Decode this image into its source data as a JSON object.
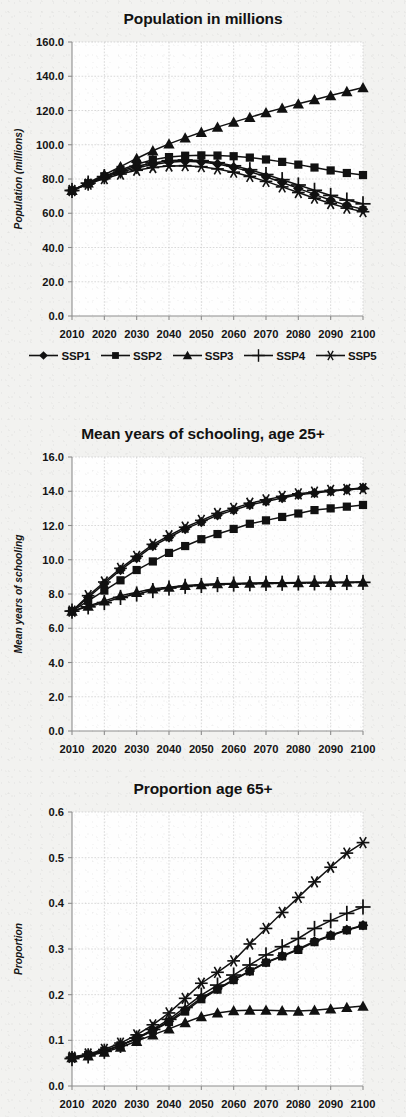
{
  "figure": {
    "background_color": "#f2f2f0",
    "series_color": "#111111"
  },
  "legend": {
    "items": [
      {
        "label": "SSP1",
        "marker": "diamond",
        "icon": "diamond-marker-icon"
      },
      {
        "label": "SSP2",
        "marker": "square",
        "icon": "square-marker-icon"
      },
      {
        "label": "SSP3",
        "marker": "triangle",
        "icon": "triangle-marker-icon"
      },
      {
        "label": "SSP4",
        "marker": "plus",
        "icon": "plus-marker-icon"
      },
      {
        "label": "SSP5",
        "marker": "asterisk",
        "icon": "asterisk-marker-icon"
      }
    ]
  },
  "chart_data": [
    {
      "id": "population",
      "type": "line",
      "title": "Population in millions",
      "xlabel": "",
      "ylabel": "Population (millions)",
      "x": [
        2010,
        2015,
        2020,
        2025,
        2030,
        2035,
        2040,
        2045,
        2050,
        2055,
        2060,
        2065,
        2070,
        2075,
        2080,
        2085,
        2090,
        2095,
        2100
      ],
      "xticks": [
        2010,
        2020,
        2030,
        2040,
        2050,
        2060,
        2070,
        2080,
        2090,
        2100
      ],
      "xticklabels": [
        "2010",
        "2020",
        "2030",
        "2040",
        "2050",
        "2060",
        "2070",
        "2080",
        "2090",
        "2100"
      ],
      "xlim": [
        2010,
        2100
      ],
      "ylim": [
        0.0,
        160.0
      ],
      "yticks": [
        0.0,
        20.0,
        40.0,
        60.0,
        80.0,
        100.0,
        120.0,
        140.0,
        160.0
      ],
      "yticklabels": [
        "0.0",
        "20.0",
        "40.0",
        "60.0",
        "80.0",
        "100.0",
        "120.0",
        "140.0",
        "160.0"
      ],
      "grid": true,
      "legend_position": "below",
      "series": [
        {
          "name": "SSP1",
          "marker": "diamond",
          "values": [
            73.3,
            77.2,
            80.8,
            83.9,
            86.5,
            88.5,
            89.8,
            90.3,
            89.9,
            88.7,
            86.8,
            84.3,
            81.3,
            78.0,
            74.5,
            71.0,
            67.6,
            64.6,
            62.3
          ]
        },
        {
          "name": "SSP2",
          "marker": "square",
          "values": [
            73.3,
            77.5,
            81.6,
            85.3,
            88.6,
            91.2,
            92.8,
            93.6,
            93.8,
            93.7,
            93.3,
            92.5,
            91.4,
            90.0,
            88.4,
            86.7,
            85.0,
            83.5,
            82.3
          ]
        },
        {
          "name": "SSP3",
          "marker": "triangle",
          "values": [
            73.3,
            77.8,
            82.5,
            87.2,
            92.0,
            96.5,
            100.5,
            104.0,
            107.3,
            110.3,
            113.2,
            116.0,
            118.8,
            121.4,
            123.9,
            126.3,
            128.7,
            131.1,
            133.4
          ]
        },
        {
          "name": "SSP4",
          "marker": "plus",
          "values": [
            73.3,
            77.6,
            81.4,
            84.7,
            87.4,
            89.4,
            90.7,
            91.1,
            90.7,
            89.5,
            87.7,
            85.4,
            82.6,
            79.6,
            76.5,
            73.4,
            70.4,
            67.7,
            65.5
          ]
        },
        {
          "name": "SSP5",
          "marker": "asterisk",
          "values": [
            73.3,
            77.0,
            80.2,
            82.9,
            85.1,
            86.7,
            87.6,
            87.8,
            87.2,
            85.9,
            84.0,
            81.5,
            78.6,
            75.4,
            72.1,
            68.8,
            65.7,
            63.0,
            60.9
          ]
        }
      ]
    },
    {
      "id": "schooling",
      "type": "line",
      "title": "Mean years of schooling, age 25+",
      "xlabel": "",
      "ylabel": "Mean years of schooling",
      "x": [
        2010,
        2015,
        2020,
        2025,
        2030,
        2035,
        2040,
        2045,
        2050,
        2055,
        2060,
        2065,
        2070,
        2075,
        2080,
        2085,
        2090,
        2095,
        2100
      ],
      "xticks": [
        2010,
        2020,
        2030,
        2040,
        2050,
        2060,
        2070,
        2080,
        2090,
        2100
      ],
      "xticklabels": [
        "2010",
        "2020",
        "2030",
        "2040",
        "2050",
        "2060",
        "2070",
        "2080",
        "2090",
        "2100"
      ],
      "xlim": [
        2010,
        2100
      ],
      "ylim": [
        0.0,
        16.0
      ],
      "yticks": [
        0.0,
        2.0,
        4.0,
        6.0,
        8.0,
        10.0,
        12.0,
        14.0,
        16.0
      ],
      "yticklabels": [
        "0.0",
        "2.0",
        "4.0",
        "6.0",
        "8.0",
        "10.0",
        "12.0",
        "14.0",
        "16.0"
      ],
      "grid": true,
      "legend_position": "none",
      "series": [
        {
          "name": "SSP1",
          "marker": "diamond",
          "values": [
            7.0,
            7.8,
            8.6,
            9.4,
            10.1,
            10.8,
            11.3,
            11.8,
            12.2,
            12.6,
            12.9,
            13.2,
            13.4,
            13.6,
            13.8,
            13.9,
            14.0,
            14.1,
            14.2
          ]
        },
        {
          "name": "SSP2",
          "marker": "square",
          "values": [
            7.0,
            7.6,
            8.2,
            8.8,
            9.4,
            9.9,
            10.4,
            10.8,
            11.2,
            11.5,
            11.8,
            12.1,
            12.3,
            12.5,
            12.7,
            12.9,
            13.0,
            13.1,
            13.2
          ]
        },
        {
          "name": "SSP3",
          "marker": "triangle",
          "values": [
            7.0,
            7.3,
            7.6,
            7.9,
            8.1,
            8.3,
            8.4,
            8.5,
            8.55,
            8.6,
            8.62,
            8.64,
            8.65,
            8.66,
            8.67,
            8.68,
            8.68,
            8.69,
            8.7
          ]
        },
        {
          "name": "SSP4",
          "marker": "plus",
          "values": [
            7.0,
            7.25,
            7.5,
            7.8,
            8.0,
            8.2,
            8.35,
            8.45,
            8.5,
            8.55,
            8.58,
            8.6,
            8.62,
            8.63,
            8.64,
            8.65,
            8.66,
            8.67,
            8.68
          ]
        },
        {
          "name": "SSP5",
          "marker": "asterisk",
          "values": [
            7.0,
            7.9,
            8.7,
            9.5,
            10.2,
            10.9,
            11.4,
            11.9,
            12.3,
            12.7,
            13.0,
            13.3,
            13.5,
            13.7,
            13.85,
            13.95,
            14.05,
            14.1,
            14.15
          ]
        }
      ]
    },
    {
      "id": "proportion65",
      "type": "line",
      "title": "Proportion age 65+",
      "xlabel": "",
      "ylabel": "Proportion",
      "x": [
        2010,
        2015,
        2020,
        2025,
        2030,
        2035,
        2040,
        2045,
        2050,
        2055,
        2060,
        2065,
        2070,
        2075,
        2080,
        2085,
        2090,
        2095,
        2100
      ],
      "xticks": [
        2010,
        2020,
        2030,
        2040,
        2050,
        2060,
        2070,
        2080,
        2090,
        2100
      ],
      "xticklabels": [
        "2010",
        "2020",
        "2030",
        "2040",
        "2050",
        "2060",
        "2070",
        "2080",
        "2090",
        "2100"
      ],
      "xlim": [
        2010,
        2100
      ],
      "ylim": [
        0.0,
        0.6
      ],
      "yticks": [
        0.0,
        0.1,
        0.2,
        0.3,
        0.4,
        0.5,
        0.6
      ],
      "yticklabels": [
        "0.0",
        "0.1",
        "0.2",
        "0.3",
        "0.4",
        "0.5",
        "0.6"
      ],
      "grid": true,
      "legend_position": "none",
      "series": [
        {
          "name": "SSP1",
          "marker": "diamond",
          "values": [
            0.063,
            0.068,
            0.077,
            0.089,
            0.104,
            0.122,
            0.142,
            0.167,
            0.193,
            0.213,
            0.233,
            0.252,
            0.271,
            0.285,
            0.3,
            0.317,
            0.33,
            0.342,
            0.352
          ]
        },
        {
          "name": "SSP2",
          "marker": "square",
          "values": [
            0.063,
            0.068,
            0.077,
            0.089,
            0.104,
            0.121,
            0.14,
            0.163,
            0.19,
            0.211,
            0.232,
            0.251,
            0.27,
            0.284,
            0.298,
            0.315,
            0.329,
            0.341,
            0.351
          ]
        },
        {
          "name": "SSP3",
          "marker": "triangle",
          "values": [
            0.062,
            0.066,
            0.074,
            0.085,
            0.098,
            0.112,
            0.125,
            0.139,
            0.152,
            0.16,
            0.165,
            0.166,
            0.166,
            0.165,
            0.164,
            0.166,
            0.169,
            0.172,
            0.175
          ]
        },
        {
          "name": "SSP4",
          "marker": "plus",
          "values": [
            0.06,
            0.066,
            0.076,
            0.089,
            0.105,
            0.124,
            0.146,
            0.172,
            0.199,
            0.221,
            0.243,
            0.265,
            0.287,
            0.305,
            0.323,
            0.345,
            0.362,
            0.378,
            0.392
          ]
        },
        {
          "name": "SSP5",
          "marker": "asterisk",
          "values": [
            0.063,
            0.07,
            0.08,
            0.094,
            0.112,
            0.134,
            0.16,
            0.192,
            0.225,
            0.249,
            0.274,
            0.311,
            0.345,
            0.38,
            0.413,
            0.447,
            0.479,
            0.51,
            0.533
          ]
        }
      ]
    }
  ]
}
